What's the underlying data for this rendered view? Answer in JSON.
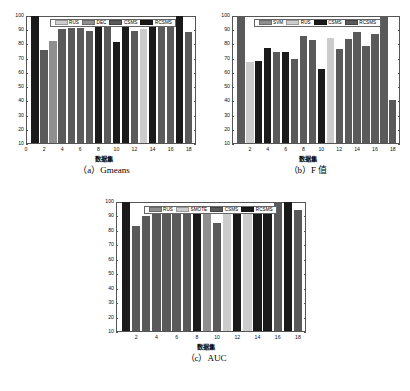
{
  "figure": {
    "background": "#ffffff",
    "panels": [
      "a",
      "b",
      "c"
    ]
  },
  "palette": {
    "light_gray": "#cccccc",
    "mid_gray": "#8f8f8f",
    "dark_gray": "#5a5a5a",
    "black": "#1a1a1a",
    "axis": "#555555"
  },
  "chart_data": [
    {
      "id": "a",
      "type": "bar",
      "title": "",
      "caption": "（a）Gmeans",
      "xlabel": "数据集",
      "ylabel": "Gmeans",
      "ylim": [
        10,
        100
      ],
      "yticks": [
        10,
        20,
        30,
        40,
        50,
        60,
        70,
        80,
        90,
        100
      ],
      "xlim": [
        0,
        18.8
      ],
      "xticks": [
        0,
        2,
        4,
        6,
        8,
        10,
        12,
        14,
        16,
        18
      ],
      "grid": false,
      "legend_position": "top-center",
      "legend": [
        {
          "label": "RUS",
          "color": "#cccccc"
        },
        {
          "label": "DEC",
          "color": "#8f8f8f"
        },
        {
          "label": "CSMS",
          "color": "#5a5a5a"
        },
        {
          "label": "RCSMS",
          "color": "#1a1a1a"
        }
      ],
      "x": [
        1,
        2,
        3,
        4,
        5,
        6,
        7,
        8,
        9,
        10,
        11,
        12,
        13,
        14,
        15,
        16,
        17,
        18
      ],
      "values": [
        100.0,
        76.0,
        82.2,
        90.8,
        91.4,
        91.4,
        89.6,
        92.8,
        92.5,
        81.6,
        92.3,
        89.7,
        90.6,
        94.0,
        92.0,
        96.6,
        100.0,
        88.8
      ],
      "bar_colors": [
        "#1a1a1a",
        "#5a5a5a",
        "#8f8f8f",
        "#5a5a5a",
        "#5a5a5a",
        "#5a5a5a",
        "#5a5a5a",
        "#1a1a1a",
        "#5a5a5a",
        "#1a1a1a",
        "#1a1a1a",
        "#5a5a5a",
        "#cccccc",
        "#1a1a1a",
        "#5a5a5a",
        "#5a5a5a",
        "#1a1a1a",
        "#5a5a5a"
      ]
    },
    {
      "id": "b",
      "type": "bar",
      "title": "",
      "caption": "（b）F 值",
      "xlabel": "数据集",
      "ylabel": "F-score",
      "ylim": [
        10,
        100
      ],
      "yticks": [
        10,
        20,
        30,
        40,
        50,
        60,
        70,
        80,
        90,
        100
      ],
      "xlim": [
        0,
        18.8
      ],
      "xticks": [
        2,
        4,
        6,
        8,
        10,
        12,
        14,
        16,
        18
      ],
      "grid": false,
      "legend_position": "top-center",
      "legend": [
        {
          "label": "SVM",
          "color": "#8f8f8f"
        },
        {
          "label": "RUS",
          "color": "#cccccc"
        },
        {
          "label": "CSMS",
          "color": "#1a1a1a"
        },
        {
          "label": "RCSMS",
          "color": "#5a5a5a"
        }
      ],
      "x": [
        1,
        2,
        3,
        4,
        5,
        6,
        7,
        8,
        9,
        10,
        11,
        12,
        13,
        14,
        15,
        16,
        17,
        18
      ],
      "values": [
        100.0,
        68.0,
        68.2,
        77.5,
        74.4,
        74.7,
        69.7,
        85.6,
        83.2,
        63.0,
        84.5,
        77.0,
        83.7,
        88.7,
        79.0,
        87.0,
        100.0,
        41.0
      ],
      "bar_colors": [
        "#5a5a5a",
        "#cccccc",
        "#1a1a1a",
        "#1a1a1a",
        "#5a5a5a",
        "#1a1a1a",
        "#5a5a5a",
        "#5a5a5a",
        "#5a5a5a",
        "#1a1a1a",
        "#cccccc",
        "#5a5a5a",
        "#5a5a5a",
        "#5a5a5a",
        "#5a5a5a",
        "#5a5a5a",
        "#5a5a5a",
        "#5a5a5a"
      ]
    },
    {
      "id": "c",
      "type": "bar",
      "title": "",
      "caption": "（c）AUC",
      "xlabel": "数据集",
      "ylabel": "AUC",
      "ylim": [
        10,
        100
      ],
      "yticks": [
        10,
        20,
        30,
        40,
        50,
        60,
        70,
        80,
        90,
        100
      ],
      "xlim": [
        0,
        18.8
      ],
      "xticks": [
        2,
        4,
        6,
        8,
        10,
        12,
        14,
        16,
        18
      ],
      "grid": false,
      "legend_position": "top-center",
      "legend": [
        {
          "label": "RUS",
          "color": "#8f8f8f"
        },
        {
          "label": "SMOTE",
          "color": "#cccccc"
        },
        {
          "label": "CSMS",
          "color": "#5a5a5a"
        },
        {
          "label": "RCSMS",
          "color": "#1a1a1a"
        }
      ],
      "x": [
        1,
        2,
        3,
        4,
        5,
        6,
        7,
        8,
        9,
        10,
        11,
        12,
        13,
        14,
        15,
        16,
        17,
        18
      ],
      "values": [
        100.0,
        83.4,
        90.3,
        95.6,
        94.4,
        96.8,
        93.6,
        95.2,
        95.8,
        85.4,
        95.4,
        91.4,
        94.4,
        96.8,
        95.2,
        99.7,
        99.8,
        94.4
      ],
      "bar_colors": [
        "#1a1a1a",
        "#5a5a5a",
        "#5a5a5a",
        "#5a5a5a",
        "#5a5a5a",
        "#5a5a5a",
        "#5a5a5a",
        "#1a1a1a",
        "#8f8f8f",
        "#5a5a5a",
        "#cccccc",
        "#1a1a1a",
        "#cccccc",
        "#1a1a1a",
        "#1a1a1a",
        "#5a5a5a",
        "#1a1a1a",
        "#5a5a5a"
      ]
    }
  ]
}
